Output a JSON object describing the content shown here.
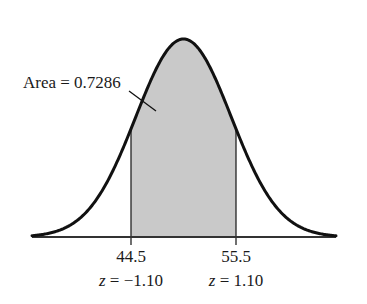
{
  "chart_data": {
    "type": "area",
    "title": "",
    "distribution": {
      "family": "normal",
      "mean": 50,
      "sd": 5
    },
    "shaded_region": {
      "from": 44.5,
      "to": 55.5,
      "z_from": -1.1,
      "z_to": 1.1,
      "area": 0.7286
    },
    "annotation": {
      "text": "Area = 0.7286"
    },
    "x_ticks": [
      {
        "value": 44.5,
        "label": "44.5",
        "z_label_var": "z",
        "z_label_rest": " = −1.10"
      },
      {
        "value": 55.5,
        "label": "55.5",
        "z_label_var": "z",
        "z_label_rest": " = 1.10"
      }
    ],
    "xlabel": "",
    "ylabel": "",
    "grid": false,
    "legend": null,
    "colors": {
      "curve": "#111111",
      "shade": "#c9c9c9",
      "axis": "#333333"
    }
  }
}
